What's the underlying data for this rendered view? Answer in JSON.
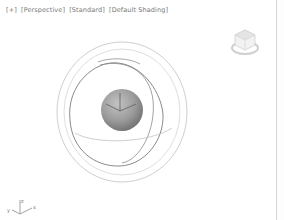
{
  "viewport": {
    "label": {
      "menu": "[+]",
      "view": "[Perspective]",
      "preset": "[Standard]",
      "shading": "[Default Shading]"
    },
    "background": "#ffffff",
    "scene": {
      "sphere": {
        "color": "#9a9a9a",
        "cx": 122,
        "cy": 110,
        "r": 21
      },
      "gizmo_rings": {
        "outer_color": "#c8c8c8",
        "inner_color": "#7a7a7a"
      }
    },
    "axis_tripod": {
      "x": "x",
      "y": "y",
      "z": "z"
    },
    "viewcube": {
      "icon": "viewcube-icon"
    }
  },
  "colors": {
    "label_text": "#777777",
    "divider": "#d8d8d8"
  }
}
